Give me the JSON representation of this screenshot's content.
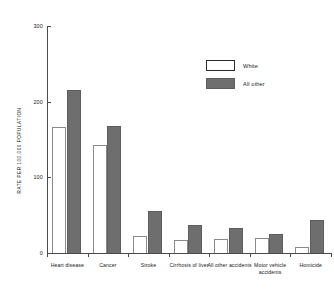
{
  "chart_data": {
    "type": "bar",
    "title": "",
    "xlabel": "",
    "ylabel": "RATE PER 100,000 POPULATION",
    "ylim": [
      0,
      300
    ],
    "yticks": [
      0,
      100,
      200,
      300
    ],
    "ytick_labels": [
      "0",
      "100",
      "200",
      "300"
    ],
    "grid": false,
    "legend_position": "upper-right-inside",
    "categories": [
      "Heart disease",
      "Cancer",
      "Stroke",
      "Cirrhosis of liver",
      "All other accidents",
      "Motor vehicle accidents",
      "Homicide"
    ],
    "series": [
      {
        "name": "White",
        "color": "#ffffff",
        "values": [
          166,
          143,
          22,
          17,
          18,
          20,
          8
        ]
      },
      {
        "name": "All other",
        "color": "#6e6e6e",
        "values": [
          215,
          168,
          55,
          37,
          33,
          25,
          43
        ]
      }
    ]
  },
  "axis": {
    "y_title": "RATE PER 100,000 POPULATION",
    "ticks": [
      {
        "label": "300",
        "value": 300
      },
      {
        "label": "200",
        "value": 200
      },
      {
        "label": "100",
        "value": 100
      },
      {
        "label": "0",
        "value": 0
      }
    ]
  },
  "legend": {
    "items": [
      {
        "label": "White",
        "swatch": "white"
      },
      {
        "label": "All other",
        "swatch": "other"
      }
    ]
  }
}
